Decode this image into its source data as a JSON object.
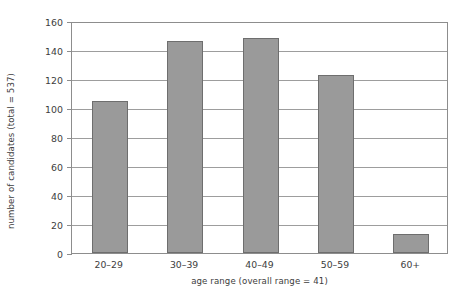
{
  "chart_data": {
    "type": "bar",
    "title": "",
    "subtitle": "",
    "xlabel": "age range (overall range = 41)",
    "ylabel": "number of candidates (total = 537)",
    "categories": [
      "20–29",
      "30–39",
      "40–49",
      "50–59",
      "60+"
    ],
    "values": [
      105,
      146,
      148,
      123,
      13
    ],
    "series": [
      {
        "name": "number of candidates",
        "values": [
          105,
          146,
          148,
          123,
          13
        ]
      }
    ],
    "ylim": [
      0,
      160
    ],
    "yticks": [
      0,
      20,
      40,
      60,
      80,
      100,
      120,
      140,
      160
    ],
    "ytick_labels": [
      "0",
      "20",
      "40",
      "60",
      "80",
      "100",
      "120",
      "140",
      "160"
    ],
    "grid": "horizontal",
    "legend": "none",
    "annotations": [],
    "colors": {
      "bar_fill": "#9a9a9a",
      "bar_border": "#6e6e6e",
      "gridline": "#9d9d9d",
      "axis": "#8d8d8d",
      "text": "#3d3d3d",
      "background": "#ffffff"
    }
  }
}
